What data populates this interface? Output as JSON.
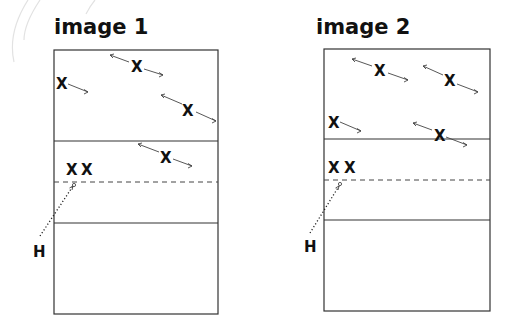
{
  "diagrams": [
    {
      "title": "image 1",
      "court": {
        "x": 54,
        "y": 50,
        "w": 164,
        "h": 264,
        "mid_line_y": 141,
        "dashed_line_y": 182,
        "lower_line_y": 223
      },
      "players": [
        {
          "label": "X",
          "x": 137,
          "y": 66,
          "arrow": "both"
        },
        {
          "label": "X",
          "x": 61,
          "y": 83,
          "arrow": "right"
        },
        {
          "label": "X",
          "x": 188,
          "y": 110,
          "arrow": "both"
        },
        {
          "label": "X",
          "x": 166,
          "y": 157,
          "arrow": "both"
        },
        {
          "label": "X",
          "x": 72,
          "y": 169,
          "arrow": "none"
        },
        {
          "label": "X",
          "x": 87,
          "y": 169,
          "arrow": "none"
        }
      ],
      "hitter": {
        "label": "H",
        "x": 38,
        "y": 252
      }
    },
    {
      "title": "image 2",
      "court": {
        "x": 324,
        "y": 49,
        "w": 166,
        "h": 262,
        "mid_line_y": 139,
        "dashed_line_y": 180,
        "lower_line_y": 220
      },
      "players": [
        {
          "label": "X",
          "x": 380,
          "y": 70,
          "arrow": "both"
        },
        {
          "label": "X",
          "x": 450,
          "y": 80,
          "arrow": "both"
        },
        {
          "label": "X",
          "x": 333,
          "y": 122,
          "arrow": "right"
        },
        {
          "label": "X",
          "x": 440,
          "y": 135,
          "arrow": "both"
        },
        {
          "label": "X",
          "x": 333,
          "y": 168,
          "arrow": "none"
        },
        {
          "label": "X",
          "x": 349,
          "y": 168,
          "arrow": "none"
        }
      ],
      "hitter": {
        "label": "H",
        "x": 309,
        "y": 247
      }
    }
  ]
}
